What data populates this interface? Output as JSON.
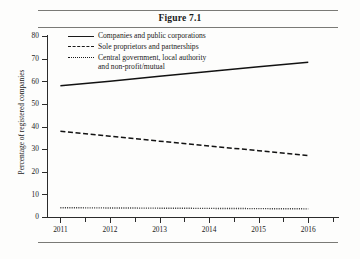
{
  "figure": {
    "title": "Figure 7.1"
  },
  "chart_data": {
    "type": "line",
    "title": "Figure 7.1",
    "xlabel": "",
    "ylabel": "Percentage of registered companies",
    "x": [
      2011,
      2012,
      2013,
      2014,
      2015,
      2016
    ],
    "xtick_labels": [
      "2011",
      "2012",
      "2013",
      "2014",
      "2015",
      "2016"
    ],
    "xlim": [
      2010.75,
      2016.6
    ],
    "ylim": [
      0,
      80
    ],
    "ytick_labels": [
      "0",
      "10",
      "20",
      "30",
      "40",
      "50",
      "60",
      "70",
      "80"
    ],
    "yticks": [
      0,
      10,
      20,
      30,
      40,
      50,
      60,
      70,
      80
    ],
    "grid": false,
    "legend_position": "top-left-inside",
    "series": [
      {
        "name": "Companies and public corporations",
        "style": "solid",
        "color": "#121212",
        "values": [
          58.0,
          60.0,
          62.2,
          64.3,
          66.4,
          68.4
        ]
      },
      {
        "name": "Sole proprietors and partnerships",
        "style": "dashed",
        "color": "#121212",
        "values": [
          37.9,
          35.7,
          33.5,
          31.4,
          29.3,
          27.2
        ]
      },
      {
        "name": "Central government, local authority\nand non-profit/mutual",
        "style": "dotted",
        "color": "#2a2a2a",
        "values": [
          4.1,
          4.0,
          3.9,
          3.8,
          3.7,
          3.6
        ]
      }
    ]
  }
}
